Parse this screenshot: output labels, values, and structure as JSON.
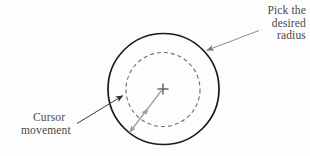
{
  "figure": {
    "background_color": "#fdfdfd",
    "ink_color": "#1a1a1a",
    "annotation_color": "#4a4a4a",
    "guide_color": "#9a9a9a",
    "dash_color": "#6e6e6e"
  },
  "annotations": {
    "pick_radius": {
      "line1": "Pick the",
      "line2": "desired",
      "line3": "radius"
    },
    "cursor_movement": {
      "line1": "Cursor",
      "line2": "movement"
    }
  },
  "shapes": {
    "outer_circle": {
      "name": "outer-solid-circle",
      "cx": 163.5,
      "cy": 89,
      "r": 55.5,
      "stroke": "#1a1a1a",
      "stroke_width": 1.6,
      "fill": "none",
      "style": "solid"
    },
    "inner_circle": {
      "name": "inner-dashed-circle",
      "cx": 163,
      "cy": 89.5,
      "r": 37,
      "stroke": "#6e6e6e",
      "stroke_width": 1.1,
      "fill": "none",
      "style": "dashed",
      "dash_pattern": "4 3"
    },
    "center_marker": {
      "name": "center-cross-marker",
      "cx": 163,
      "cy": 89,
      "arm": 5.5,
      "stroke": "#5a5a5a",
      "stroke_width": 1.4
    },
    "radius_arrow": {
      "name": "radius-drag-arrow",
      "x1": 163,
      "y1": 89,
      "x2": 128,
      "y2": 134,
      "stroke": "#9a9a9a",
      "stroke_width": 1.2,
      "arrowheads": "both"
    },
    "pick_radius_leader": {
      "name": "pick-radius-leader-arrow",
      "x1": 259,
      "y1": 31,
      "x2": 205,
      "y2": 51,
      "stroke": "#8c8c8c",
      "stroke_width": 1.0,
      "arrowheads": "end"
    },
    "cursor_movement_leader": {
      "name": "cursor-movement-leader-arrow",
      "x1": 78,
      "y1": 123,
      "x2": 124,
      "y2": 95,
      "stroke": "#3a3a3a",
      "stroke_width": 1.0,
      "arrowheads": "end"
    }
  }
}
